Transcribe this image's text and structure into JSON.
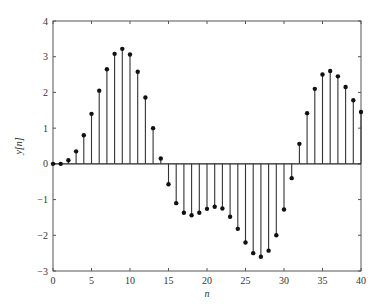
{
  "chart_data": {
    "type": "stem",
    "title": "",
    "xlabel": "n",
    "ylabel": "y[n]",
    "xlim": [
      0,
      40
    ],
    "ylim": [
      -3,
      4
    ],
    "x_ticks": [
      0,
      5,
      10,
      15,
      20,
      25,
      30,
      35,
      40
    ],
    "y_ticks": [
      -3,
      -2,
      -1,
      0,
      1,
      2,
      3,
      4
    ],
    "grid": false,
    "legend": null,
    "x": [
      0,
      1,
      2,
      3,
      4,
      5,
      6,
      7,
      8,
      9,
      10,
      11,
      12,
      13,
      14,
      15,
      16,
      17,
      18,
      19,
      20,
      21,
      22,
      23,
      24,
      25,
      26,
      27,
      28,
      29,
      30,
      31,
      32,
      33,
      34,
      35,
      36,
      37,
      38,
      39,
      40
    ],
    "values": [
      0,
      0,
      0.1,
      0.35,
      0.8,
      1.4,
      2.05,
      2.65,
      3.08,
      3.22,
      3.06,
      2.58,
      1.86,
      1.0,
      0.15,
      -0.57,
      -1.1,
      -1.37,
      -1.44,
      -1.37,
      -1.26,
      -1.2,
      -1.25,
      -1.48,
      -1.82,
      -2.2,
      -2.5,
      -2.6,
      -2.43,
      -2.0,
      -1.28,
      -0.4,
      0.56,
      1.42,
      2.1,
      2.5,
      2.6,
      2.45,
      2.15,
      1.78,
      1.45
    ]
  }
}
